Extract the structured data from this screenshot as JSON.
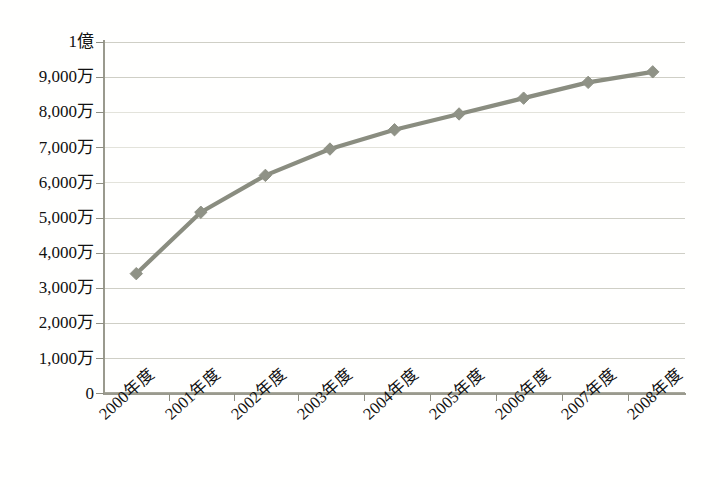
{
  "chart_data": {
    "type": "line",
    "title": "",
    "xlabel": "",
    "ylabel": "",
    "categories": [
      "2000年度",
      "2001年度",
      "2002年度",
      "2003年度",
      "2004年度",
      "2005年度",
      "2006年度",
      "2007年度",
      "2008年度"
    ],
    "values": [
      34000000,
      51500000,
      62000000,
      69500000,
      75000000,
      79500000,
      84000000,
      88500000,
      91500000
    ],
    "series": [
      {
        "name": "",
        "values": [
          34000000,
          51500000,
          62000000,
          69500000,
          75000000,
          79500000,
          84000000,
          88500000,
          91500000
        ]
      }
    ],
    "ylim": [
      0,
      100000000
    ],
    "ytick_values": [
      0,
      10000000,
      20000000,
      30000000,
      40000000,
      50000000,
      60000000,
      70000000,
      80000000,
      90000000,
      100000000
    ],
    "ytick_labels": [
      "0",
      "1,000万",
      "2,000万",
      "3,000万",
      "4,000万",
      "5,000万",
      "6,000万",
      "7,000万",
      "8,000万",
      "9,000万",
      "1億"
    ],
    "grid": true,
    "legend": "none",
    "marker": "diamond",
    "line_color": "#8a8d80",
    "marker_color": "#8f9286",
    "gridline_color": "#cfcfc6",
    "axis_color": "#9a9a8e",
    "background_color": "#ffffff"
  },
  "caption": ""
}
